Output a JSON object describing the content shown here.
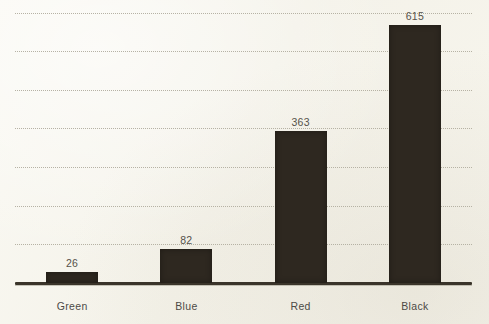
{
  "chart_data": {
    "type": "bar",
    "title": "",
    "subtitle": "",
    "xlabel": "",
    "ylabel": "",
    "categories": [
      "Green",
      "Blue",
      "Red",
      "Black"
    ],
    "values": [
      26,
      82,
      363,
      615
    ],
    "data_labels": [
      "26",
      "82",
      "363",
      "615"
    ],
    "ylim": [
      0,
      655
    ],
    "grid": true,
    "gridlines": [
      92,
      184,
      276,
      368,
      460,
      552,
      644
    ],
    "legend": "none",
    "axis_ticks_visible": false,
    "bar_color": "#2e2820",
    "background_color": "#f7f5ee",
    "gridline_color": "#b3afa1",
    "axis_color": "#3a342a",
    "label_color": "#4c4a46",
    "value_label_color": "#55514a"
  }
}
